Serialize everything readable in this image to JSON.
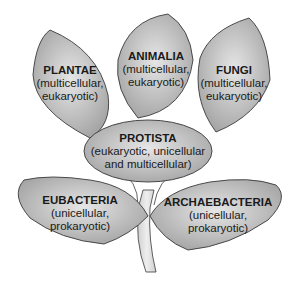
{
  "diagram": {
    "type": "kingdom-tree",
    "colors": {
      "leaf_fill_light": "#e4e4e4",
      "leaf_fill_dark": "#a9a9a9",
      "outline": "#3a3a3a",
      "stem": "#d8d8d8"
    },
    "nodes": {
      "plantae": {
        "title": "PLANTAE",
        "line1": "(multicellular,",
        "line2": "eukaryotic)"
      },
      "animalia": {
        "title": "ANIMALIA",
        "line1": "(multicellular,",
        "line2": "eukaryotic)"
      },
      "fungi": {
        "title": "FUNGI",
        "line1": "(multicellular,",
        "line2": "eukaryotic)"
      },
      "protista": {
        "title": "PROTISTA",
        "line1": "(eukaryotic, unicellular",
        "line2": "and multicellular)"
      },
      "eubacteria": {
        "title": "EUBACTERIA",
        "line1": "(unicellular,",
        "line2": "prokaryotic)"
      },
      "archaebacteria": {
        "title": "ARCHAEBACTERIA",
        "line1": "(unicellular,",
        "line2": "prokaryotic)"
      }
    }
  }
}
